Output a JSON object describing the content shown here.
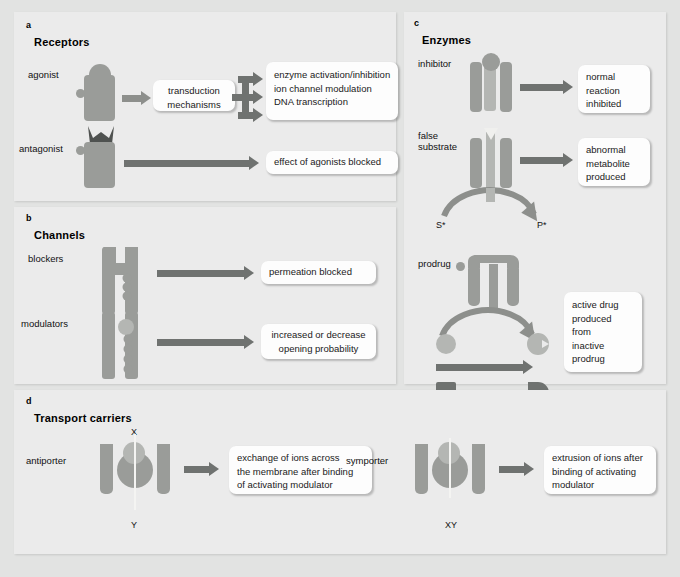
{
  "figure": {
    "panels": [
      {
        "letter": "a",
        "title": "Receptors",
        "rows": [
          {
            "label": "agonist",
            "middle_box": [
              "transduction",
              "mechanisms"
            ],
            "outcomes": [
              "enzyme activation/inhibition",
              "ion channel modulation",
              "DNA transcription"
            ]
          },
          {
            "label": "antagonist",
            "outcomes": [
              "effect of agonists blocked"
            ]
          }
        ]
      },
      {
        "letter": "b",
        "title": "Channels",
        "rows": [
          {
            "label": "blockers",
            "outcomes": [
              "permeation blocked"
            ]
          },
          {
            "label": "modulators",
            "outcomes": [
              "increased or decrease",
              "opening probability"
            ]
          }
        ]
      },
      {
        "letter": "c",
        "title": "Enzymes",
        "rows": [
          {
            "label": "inhibitor",
            "outcomes": [
              "normal",
              "reaction",
              "inhibited"
            ]
          },
          {
            "label": "false substrate",
            "label_lines": [
              "false",
              "substrate"
            ],
            "outcomes": [
              "abnormal",
              "metabolite",
              "produced"
            ],
            "annotations": [
              "S*",
              "P*"
            ]
          },
          {
            "label": "prodrug",
            "outcomes": [
              "active drug",
              "produced",
              "from",
              "inactive",
              "prodrug"
            ]
          }
        ]
      },
      {
        "letter": "d",
        "title": "Transport carriers",
        "rows": [
          {
            "label": "antiporter",
            "annotation_top": "X",
            "annotation_bottom": "Y",
            "outcomes": [
              "exchange of ions across",
              "the membrane after binding",
              "of activating modulator"
            ]
          },
          {
            "label": "symporter",
            "annotation_bottom": "XY",
            "outcomes": [
              "extrusion of ions after",
              "binding of activating",
              "modulator"
            ]
          }
        ]
      }
    ]
  },
  "colors": {
    "page_background": "#e2e3e2",
    "panel_background": "#ebebeb",
    "callout_background": "#fdfdfd",
    "shape_grey": "#9a9c99",
    "shape_dark_grey": "#6f7270",
    "shape_light_grey": "#b4b6b3",
    "arrow_grey": "#8d8f8c",
    "text": "#111111"
  }
}
